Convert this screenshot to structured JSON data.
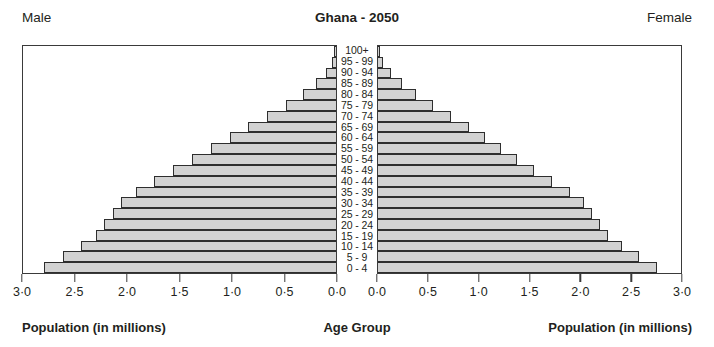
{
  "header": {
    "male_label": "Male",
    "female_label": "Female",
    "title": "Ghana - 2050"
  },
  "captions": {
    "left": "Population (in millions)",
    "center": "Age Group",
    "right": "Population (in millions)"
  },
  "axis": {
    "left_ticks": [
      "3·0",
      "2·5",
      "2·0",
      "1·5",
      "1·0",
      "0·5",
      "0·0"
    ],
    "right_ticks": [
      "0·0",
      "0·5",
      "1·0",
      "1·5",
      "2·0",
      "2·5",
      "3·0"
    ]
  },
  "style": {
    "bar_fill": "#d2d2d2",
    "bar_stroke": "#2e2e2e",
    "frame": "#3a3a3a",
    "text": "#231f20",
    "background": "#ffffff"
  },
  "chart_data": {
    "type": "bar",
    "subtype": "population-pyramid",
    "title": "Ghana - 2050",
    "xlabel": "Population (in millions)",
    "ylabel": "Age Group",
    "xlim": [
      0,
      3.0
    ],
    "xtick_step": 0.5,
    "grid": false,
    "legend": [
      "Male",
      "Female"
    ],
    "legend_position": "top-corners",
    "categories": [
      "0 - 4",
      "5 - 9",
      "10 - 14",
      "15 - 19",
      "20 - 24",
      "25 - 29",
      "30 - 34",
      "35 - 39",
      "40 - 44",
      "45 - 49",
      "50 - 54",
      "55 - 59",
      "60 - 64",
      "65 - 69",
      "70 - 74",
      "75 - 79",
      "80 - 84",
      "85 - 89",
      "90 - 94",
      "95 - 99",
      "100+"
    ],
    "series": [
      {
        "name": "Male",
        "side": "left",
        "values": [
          2.8,
          2.62,
          2.44,
          2.3,
          2.22,
          2.14,
          2.06,
          1.92,
          1.74,
          1.56,
          1.38,
          1.2,
          1.02,
          0.84,
          0.66,
          0.48,
          0.32,
          0.19,
          0.1,
          0.04,
          0.01
        ]
      },
      {
        "name": "Female",
        "side": "right",
        "values": [
          2.76,
          2.58,
          2.42,
          2.28,
          2.2,
          2.12,
          2.04,
          1.9,
          1.72,
          1.54,
          1.38,
          1.22,
          1.06,
          0.9,
          0.72,
          0.54,
          0.38,
          0.24,
          0.13,
          0.05,
          0.01
        ]
      }
    ]
  }
}
